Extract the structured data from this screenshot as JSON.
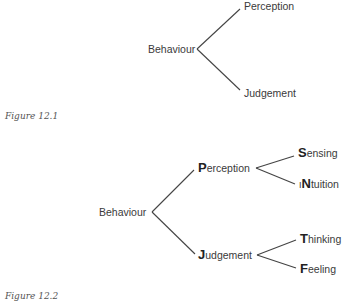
{
  "figure1": {
    "caption": "Figure 12.1",
    "root": "Behaviour",
    "branches": [
      "Perception",
      "Judgement"
    ]
  },
  "figure2": {
    "caption": "Figure 12.2",
    "root": "Behaviour",
    "branches": [
      {
        "initial": "P",
        "rest": "erception",
        "children": [
          {
            "prefix": "",
            "initial": "S",
            "rest": "ensing"
          },
          {
            "prefix": "I",
            "initial": "N",
            "rest": "tuition"
          }
        ]
      },
      {
        "initial": "J",
        "rest": "udgement",
        "children": [
          {
            "prefix": "",
            "initial": "T",
            "rest": "hinking"
          },
          {
            "prefix": "",
            "initial": "F",
            "rest": "eeling"
          }
        ]
      }
    ]
  }
}
